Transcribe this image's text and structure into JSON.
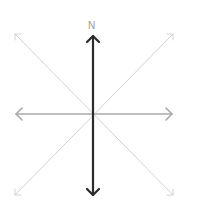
{
  "diagram": {
    "type": "compass-rose",
    "north_label": "N",
    "center": [
      93,
      114
    ],
    "colors": {
      "primary_axis": "#2a2a2a",
      "horizontal_axis": "#a8a8a8",
      "diagonal_axis": "#d0d0d0",
      "label": "#9a9a9a",
      "background": "#ffffff"
    },
    "axes": [
      {
        "name": "north-south",
        "from": [
          93,
          35
        ],
        "to": [
          93,
          196
        ],
        "emphasis": "strong",
        "arrowheads": "both"
      },
      {
        "name": "east-west",
        "from": [
          15,
          114
        ],
        "to": [
          173,
          114
        ],
        "emphasis": "medium",
        "arrowheads": "both"
      },
      {
        "name": "northwest-southeast",
        "from": [
          14,
          33
        ],
        "to": [
          174,
          196
        ],
        "emphasis": "light",
        "arrowheads": "both"
      },
      {
        "name": "northeast-southwest",
        "from": [
          174,
          33
        ],
        "to": [
          14,
          196
        ],
        "emphasis": "light",
        "arrowheads": "both"
      }
    ]
  }
}
